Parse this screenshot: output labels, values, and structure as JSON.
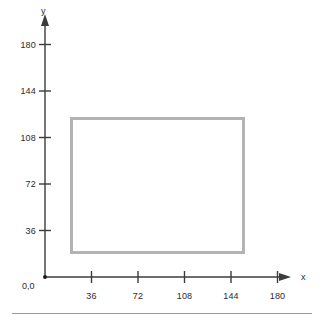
{
  "chart_data": {
    "type": "scatter",
    "title": "",
    "xlabel": "x",
    "ylabel": "y",
    "origin_label": "0,0",
    "xlim": [
      0,
      198
    ],
    "ylim": [
      0,
      198
    ],
    "x_ticks": [
      36,
      72,
      108,
      144,
      180
    ],
    "y_ticks": [
      36,
      72,
      108,
      144,
      180
    ],
    "x_tick_labels": [
      "36",
      "72",
      "108",
      "144",
      "180"
    ],
    "y_tick_labels": [
      "36",
      "72",
      "108",
      "144",
      "180"
    ],
    "grid": false,
    "legend": null,
    "annotations": [],
    "shapes": [
      {
        "name": "rectangle",
        "type": "rect",
        "x": 19,
        "y": 18,
        "width": 136,
        "height": 106,
        "stroke_color": "#b3b3b3",
        "stroke_width": 3,
        "fill": "none"
      }
    ],
    "axis_color": "#3c3c3c",
    "tick_color": "#3c3c3c",
    "text_color": "#2b2b2b"
  },
  "figure": {
    "x_axis_name": "x",
    "y_axis_name": "y",
    "origin_text": "0,0"
  },
  "colors": {
    "background": "#ffffff",
    "axis": "#3c3c3c",
    "shape_stroke": "#b3b3b3",
    "rule": "#9a9a9a",
    "text": "#2b2b2b"
  }
}
